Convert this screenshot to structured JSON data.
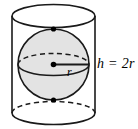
{
  "figure": {
    "labels": {
      "radius": "r",
      "height": "h = 2r"
    },
    "colors": {
      "stroke": "#1a1a1a",
      "sphere_fill": "#e3e3e3",
      "cylinder_fill": "#ffffff",
      "background": "#ffffff",
      "dot_fill": "#000000"
    },
    "geometry": {
      "cylinder": {
        "center_x": 53.5,
        "radius_x": 41.5,
        "radius_y": 11.5,
        "top_y": 16,
        "bottom_y": 113
      },
      "sphere": {
        "center_x": 53.5,
        "center_y": 64.5,
        "radius": 35.5,
        "equator_radius_y": 11.0
      },
      "points": [
        {
          "name": "north-pole",
          "x": 53.5,
          "y": 29
        },
        {
          "name": "center",
          "x": 53.5,
          "y": 64.5
        },
        {
          "name": "south-pole",
          "x": 53.5,
          "y": 100
        }
      ],
      "radius_line": {
        "x1": 53.5,
        "y1": 64.5,
        "x2": 89,
        "y2": 64.5
      }
    }
  }
}
